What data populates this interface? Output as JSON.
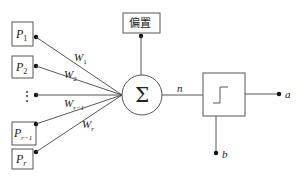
{
  "diagram": {
    "inputs": [
      {
        "id": "p1",
        "base": "P",
        "sub": "1",
        "weight_base": "W",
        "weight_sub": "1"
      },
      {
        "id": "p2",
        "base": "P",
        "sub": "2",
        "weight_base": "W",
        "weight_sub": "2"
      },
      {
        "id": "ellipsis",
        "base": "⋮",
        "sub": "",
        "weight_base": "W",
        "weight_sub": "r−1"
      },
      {
        "id": "pr-1",
        "base": "P",
        "sub": "r−1",
        "weight_base": "W",
        "weight_sub": "r"
      },
      {
        "id": "pr",
        "base": "P",
        "sub": "r",
        "weight_base": "",
        "weight_sub": ""
      }
    ],
    "bias_label": "偏置",
    "summation_symbol": "Σ",
    "net_input_label": "n",
    "transfer_function": "hard-limit step",
    "output_label": "a",
    "threshold_label": "b"
  }
}
